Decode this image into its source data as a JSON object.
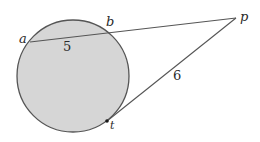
{
  "diagram": {
    "type": "geometry-secant-tangent",
    "colors": {
      "circle_fill": "#d6d6d6",
      "circle_stroke": "#555555",
      "line_stroke": "#555555",
      "text": "#2a2a2a",
      "background": "#ffffff"
    },
    "circle": {
      "cx": 73,
      "cy": 76,
      "r": 56
    },
    "points": {
      "a": {
        "label": "a",
        "x": 30,
        "y": 42
      },
      "b": {
        "label": "b",
        "x": 105,
        "y": 32
      },
      "p": {
        "label": "p",
        "x": 236,
        "y": 18
      },
      "t": {
        "label": "t",
        "x": 107,
        "y": 121
      }
    },
    "segments": [
      {
        "name": "secant",
        "from": "a",
        "to": "p"
      },
      {
        "name": "tangent",
        "from": "t",
        "to": "p"
      }
    ],
    "measurements": {
      "ab": {
        "label": "5",
        "x": 64,
        "y": 50
      },
      "pt": {
        "label": "6",
        "x": 176,
        "y": 80
      }
    }
  }
}
